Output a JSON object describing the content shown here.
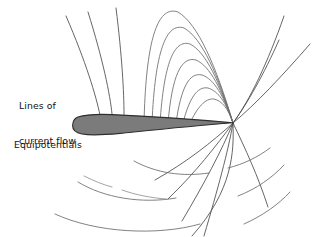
{
  "figure": {
    "type": "field-diagram",
    "background_color": "#ffffff",
    "labels": {
      "current_flow_line1": "Lines of",
      "current_flow_line2": "current flow",
      "equipotentials": "Equipotentials"
    },
    "colors": {
      "body_fill": "#7b7b7b",
      "body_stroke": "#2e2e2e",
      "fieldline_stroke": "#4a4a4a",
      "equipotential_stroke": "#6b6b6b",
      "equipotential_faint_stroke": "#8c8c8c",
      "text": "#111111"
    },
    "geometry": {
      "leading_edge": [
        77,
        125
      ],
      "trailing_edge": [
        233,
        123
      ],
      "chord_length": 156,
      "max_thickness": 19,
      "convergence_point": [
        233,
        123
      ]
    },
    "airfoil_path": "M 78 117 C 86 114.5 98 114 112 114.6 C 140 115.8 186 118.6 233 122.8 C 186 126.6 150 130.4 120 133.4 C 104 134.9 90 135.4 82 134 C 75.5 132.8 72.5 129.8 72.6 125.6 C 72.7 121.2 74.6 118.2 78 117 Z",
    "field_lines": [
      "M 100 115 C 96 96 86 62 66 16",
      "M 112 114 C 110 94 103 60 88 12",
      "M 124 114.5 C 124 92 122 56 116 8",
      "M 233 123 C 250 100 268 62 284 16",
      "M 233 123 C 256 104 282 76 310 44",
      "M 233 123 C 247 104 264 74 279 40",
      "M 233 123 C 234 152 233 190 192 236",
      "M 233 123 C 228 152 218 188 204 236",
      "M 233 123 C 222 150 204 184 182 221",
      "M 233 123 C 216 146 196 172 168 199",
      "M 233 123 C 212 142 187 162 155 180",
      "M 233 123 C 245 148 258 176 268 207"
    ],
    "equipotentials_upper": [
      "M 233 123 C 216 66 198 24 178 12 C 158 5 146 38 144 123",
      "M 233 123 C 218 75 202 38 184 28 C 166 22 155 52 152 123",
      "M 233 123 C 220 83 206 52 190 44 C 174 39 164 63 160 123",
      "M 233 123 C 222 90 210 66 196 60 C 181 56 172 76 168 123",
      "M 233 123 C 224 96 214 79 202 75 C 189 72 181 88 176 123",
      "M 233 123 C 226 102 218 91 208 88 C 197 86 189 99 183 123",
      "M 233 123 C 228 108 222 101 214 99 C 205 98 197 108 190 123"
    ],
    "equipotentials_lower": [
      "M 134 161 C 156 173 182 177 209 173",
      "M 78 182 C 104 198 142 204 176 198",
      "M 55 214 C 96 233 158 236 200 224",
      "M 228 168 C 244 164 258 157 270 148",
      "M 238 196 C 256 189 272 178 284 165",
      "M 244 224 C 262 216 278 205 290 192"
    ],
    "equipotential_segments_faint": [
      "M 84 176 C 94 181 104 185 112 187",
      "M 122 190 C 136 195 152 198 166 199"
    ]
  }
}
